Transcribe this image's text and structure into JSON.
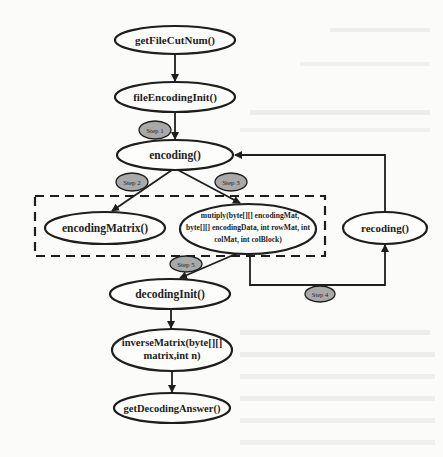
{
  "diagram": {
    "type": "flowchart",
    "nodes": {
      "getFileCutNum": "getFileCutNum()",
      "fileEncodingInit": "fileEncodingInit()",
      "encoding": "encoding()",
      "encodingMatrix": "encodingMatrix()",
      "multiply_line1": "mutiply(byte[][] encodingMat,",
      "multiply_line2": "byte[][] encodingData, int rowMat, int",
      "multiply_line3": "colMat, int colBlock)",
      "recoding": "recoding()",
      "decodingInit": "decodingInit()",
      "inverseMatrix_line1": "inverseMatrix(byte[][]",
      "inverseMatrix_line2": "matrix,int n)",
      "getDecodingAnswer": "getDecodingAnswer()"
    },
    "steps": {
      "step1": "Step 1",
      "step2": "Step 2",
      "step3": "Step 3",
      "step4": "Step 4",
      "step5": "Step 5"
    },
    "edges": [
      {
        "from": "getFileCutNum()",
        "to": "fileEncodingInit()"
      },
      {
        "from": "fileEncodingInit()",
        "to": "encoding()",
        "label": "Step 1"
      },
      {
        "from": "encoding()",
        "to": "encodingMatrix()",
        "label": "Step 2"
      },
      {
        "from": "encoding()",
        "to": "mutiply(...)",
        "label": "Step 3"
      },
      {
        "from": "mutiply(...)",
        "to": "recoding()",
        "label": "Step 4"
      },
      {
        "from": "recoding()",
        "to": "encoding()"
      },
      {
        "from": "mutiply(...)",
        "to": "decodingInit()",
        "label": "Step 5"
      },
      {
        "from": "decodingInit()",
        "to": "inverseMatrix(byte[][] matrix,int n)"
      },
      {
        "from": "inverseMatrix(byte[][] matrix,int n)",
        "to": "getDecodingAnswer()"
      }
    ],
    "group": {
      "style": "dashed",
      "contains": [
        "encodingMatrix()",
        "mutiply(...)"
      ]
    }
  },
  "colors": {
    "background": "#fbfbfa",
    "stroke": "#1e1e1e",
    "step_fill": "#a9a9a9"
  }
}
